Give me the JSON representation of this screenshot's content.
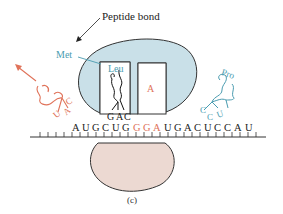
{
  "diagram": {
    "title_label": "Peptide bond",
    "caption": "(c)",
    "colors": {
      "large_subunit_fill": "#c9e0e8",
      "small_subunit_fill": "#ecd9d2",
      "outline": "#333333",
      "red_accent": "#e0735a",
      "blue_accent": "#4a9cb0",
      "text": "#222222"
    },
    "p_site": {
      "amino_acid_chain": "Met",
      "amino_acid": "Leu",
      "anticodon": [
        "G",
        "A",
        "C"
      ]
    },
    "a_site": {
      "label": "A"
    },
    "exiting_trna": {
      "anticodon": [
        "C",
        "A",
        "U"
      ]
    },
    "incoming_trna": {
      "amino_acid": "Pro",
      "anticodon": [
        "C",
        "C",
        "U"
      ]
    },
    "mrna": {
      "sequence": [
        "A",
        "U",
        "G",
        "C",
        "U",
        "G",
        "G",
        "G",
        "A",
        "U",
        "G",
        "A",
        "C",
        "U",
        "C",
        "C",
        "A",
        "U"
      ],
      "highlighted_codon": "GGA",
      "highlight_indices": [
        6,
        7,
        8
      ]
    }
  }
}
